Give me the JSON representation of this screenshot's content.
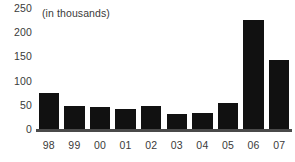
{
  "chart_data": {
    "type": "bar",
    "title": "",
    "subtitle": "",
    "units_caption": "(in thousands)",
    "xlabel": "",
    "ylabel": "",
    "categories": [
      "98",
      "99",
      "00",
      "01",
      "02",
      "03",
      "04",
      "05",
      "06",
      "07"
    ],
    "values": [
      74,
      48,
      45,
      42,
      47,
      32,
      34,
      54,
      225,
      143
    ],
    "series": [
      {
        "name": "",
        "values": [
          74,
          48,
          45,
          42,
          47,
          32,
          34,
          54,
          225,
          143
        ]
      }
    ],
    "ylim": [
      0,
      250
    ],
    "ytick_labels": [
      "0",
      "50",
      "100",
      "150",
      "200",
      "250"
    ],
    "ytick_values": [
      0,
      50,
      100,
      150,
      200,
      250
    ],
    "grid": false,
    "legend": false,
    "legend_position": "none",
    "bar_color": "#111111",
    "axis_color": "#4a4a4a",
    "text_color": "#3a3a3a",
    "background_color": "#ffffff"
  }
}
